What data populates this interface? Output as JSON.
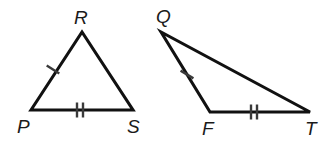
{
  "figure": {
    "background_color": "#ffffff",
    "stroke_color": "#111111",
    "tick_color": "#3a3a3a",
    "label_color": "#1a1a1a",
    "width": 328,
    "height": 149
  },
  "triangles": [
    {
      "id": "left",
      "name": "triangle-PRS",
      "vertices": [
        {
          "label": "P",
          "x": 31,
          "y": 110,
          "label_x": 17,
          "label_y": 133
        },
        {
          "label": "R",
          "x": 82,
          "y": 32,
          "label_x": 74,
          "label_y": 24
        },
        {
          "label": "S",
          "x": 133,
          "y": 110,
          "label_x": 127,
          "label_y": 133
        }
      ],
      "path": "M 31 110 L 82 32 L 133 110 Z",
      "tick_groups": [
        {
          "side": "PR",
          "count": 1,
          "cx": 53,
          "cy": 69.5,
          "angle": 33
        },
        {
          "side": "PS",
          "count": 2,
          "cx": 80,
          "cy": 110,
          "angle": 90
        }
      ]
    },
    {
      "id": "right",
      "name": "triangle-QFT",
      "vertices": [
        {
          "label": "Q",
          "x": 161,
          "y": 32,
          "label_x": 156,
          "label_y": 23
        },
        {
          "label": "F",
          "x": 210,
          "y": 112,
          "label_x": 202,
          "label_y": 135
        },
        {
          "label": "T",
          "x": 310,
          "y": 112,
          "label_x": 305,
          "label_y": 135
        }
      ],
      "path": "M 161 32 L 210 112 L 310 112 Z",
      "tick_groups": [
        {
          "side": "QF",
          "count": 1,
          "cx": 187,
          "cy": 74.5,
          "angle": 31
        },
        {
          "side": "FT",
          "count": 2,
          "cx": 254,
          "cy": 112,
          "angle": 90
        }
      ]
    }
  ],
  "tick_style": {
    "length": 15,
    "spacing": 6
  }
}
